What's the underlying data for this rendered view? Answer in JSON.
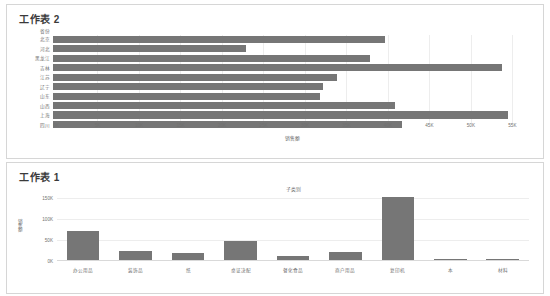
{
  "dashboard": {
    "background": "#ffffff",
    "bar_color": "#767676",
    "grid_color": "#ededed",
    "text_color": "#707070"
  },
  "sheets": [
    {
      "title": "工作表 2",
      "chart_data": {
        "type": "bar",
        "orientation": "horizontal",
        "title": "",
        "axis_corner_label": "省份",
        "xlabel": "销售额",
        "ylabel": "",
        "categories": [
          "北京",
          "河北",
          "黑龙江",
          "吉林",
          "江苏",
          "辽宁",
          "山东",
          "山西",
          "上海",
          "四川"
        ],
        "values": [
          39800,
          23100,
          38000,
          53800,
          34000,
          32300,
          32000,
          41000,
          54500,
          41800
        ],
        "xlim": [
          0,
          57000
        ],
        "xticks": [
          "0K",
          "5K",
          "10K",
          "15K",
          "20K",
          "25K",
          "30K",
          "35K",
          "40K",
          "45K",
          "50K",
          "55K"
        ],
        "xtick_values": [
          0,
          5000,
          10000,
          15000,
          20000,
          25000,
          30000,
          35000,
          40000,
          45000,
          50000,
          55000
        ],
        "grid": true,
        "legend": "none"
      }
    },
    {
      "title": "工作表 1",
      "chart_data": {
        "type": "bar",
        "orientation": "vertical",
        "title": "子类别",
        "xlabel": "",
        "ylabel": "销售额",
        "categories": [
          "办公用品",
          "装饰品",
          "纸",
          "桌证决配",
          "餐化食品",
          "商户用品",
          "复印机",
          "本",
          "材料"
        ],
        "values": [
          71000,
          25000,
          18000,
          47000,
          13000,
          21000,
          154000,
          4000,
          6000
        ],
        "ylim": [
          0,
          160000
        ],
        "yticks": [
          "150K",
          "100K",
          "50K",
          "0K"
        ],
        "ytick_values": [
          150000,
          100000,
          50000,
          0
        ],
        "grid": true,
        "legend": "none"
      }
    }
  ]
}
